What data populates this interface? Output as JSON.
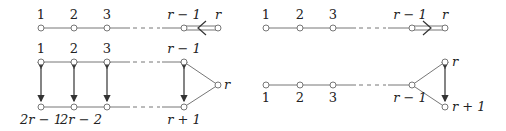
{
  "diagram": {
    "left": {
      "top_row": {
        "labels": [
          "1",
          "2",
          "3",
          "r − 1",
          "r"
        ],
        "double_edge_arrow": "left"
      },
      "folded": {
        "top_labels": [
          "1",
          "2",
          "3",
          "r − 1"
        ],
        "apex_label": "r",
        "bottom_labels": [
          "2r − 1",
          "2r − 2",
          "r + 1"
        ]
      }
    },
    "right": {
      "top_row": {
        "labels": [
          "1",
          "2",
          "3",
          "r − 1",
          "r"
        ],
        "double_edge_arrow": "right"
      },
      "forked": {
        "chain_labels": [
          "1",
          "2",
          "3",
          "r − 1"
        ],
        "fork_labels": [
          "r",
          "r + 1"
        ]
      }
    }
  }
}
